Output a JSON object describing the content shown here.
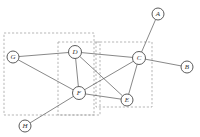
{
  "figure": {
    "type": "graph-diagram",
    "background_color": "#ffffff",
    "node_fill": "#ffffff",
    "node_stroke": "#4a4a4a",
    "edge_color": "#555555",
    "cluster_stroke": "#9a9a9a"
  },
  "nodes": [
    {
      "id": "A",
      "label": "A",
      "x": 158,
      "y": 14,
      "r": 6.0
    },
    {
      "id": "B",
      "label": "B",
      "x": 187,
      "y": 67,
      "r": 6.0
    },
    {
      "id": "C",
      "label": "C",
      "x": 139,
      "y": 58,
      "r": 6.5
    },
    {
      "id": "D",
      "label": "D",
      "x": 75,
      "y": 52,
      "r": 6.5
    },
    {
      "id": "E",
      "label": "E",
      "x": 127,
      "y": 100,
      "r": 6.0
    },
    {
      "id": "F",
      "label": "F",
      "x": 79,
      "y": 93,
      "r": 6.5
    },
    {
      "id": "G",
      "label": "G",
      "x": 13,
      "y": 57,
      "r": 6.0
    },
    {
      "id": "H",
      "label": "H",
      "x": 25,
      "y": 126,
      "r": 6.0
    }
  ],
  "edges": [
    {
      "from": "G",
      "to": "D"
    },
    {
      "from": "G",
      "to": "F"
    },
    {
      "from": "D",
      "to": "C"
    },
    {
      "from": "D",
      "to": "F"
    },
    {
      "from": "D",
      "to": "E"
    },
    {
      "from": "C",
      "to": "A"
    },
    {
      "from": "C",
      "to": "B"
    },
    {
      "from": "C",
      "to": "F"
    },
    {
      "from": "C",
      "to": "E"
    },
    {
      "from": "F",
      "to": "E"
    },
    {
      "from": "F",
      "to": "H"
    }
  ],
  "clusters": [
    {
      "id": "cluster-left",
      "x": 4,
      "y": 33,
      "width": 90,
      "height": 82
    },
    {
      "id": "cluster-middle",
      "x": 58,
      "y": 42,
      "width": 42,
      "height": 73
    },
    {
      "id": "cluster-right",
      "x": 96,
      "y": 42,
      "width": 56,
      "height": 65
    }
  ]
}
